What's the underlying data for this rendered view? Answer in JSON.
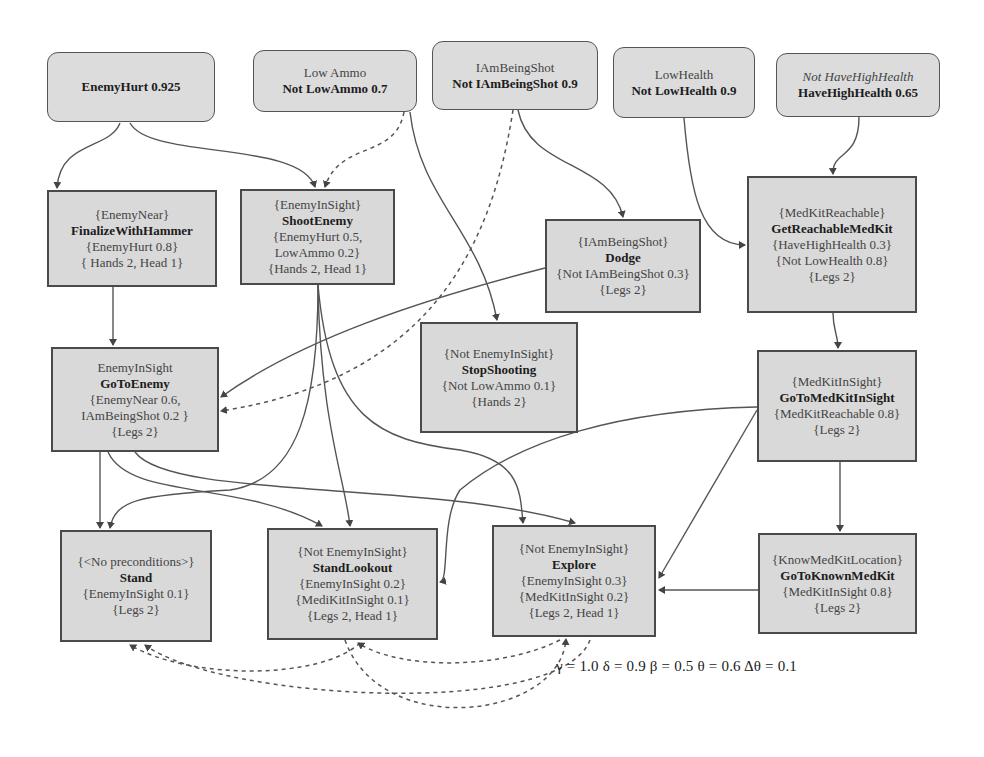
{
  "goals": [
    {
      "id": "enemy-hurt",
      "lines": [
        {
          "text": "EnemyHurt 0.925",
          "style": "bold"
        }
      ]
    },
    {
      "id": "low-ammo",
      "lines": [
        {
          "text": "Low Ammo",
          "style": "light"
        },
        {
          "text": "Not LowAmmo 0.7",
          "style": "bold"
        }
      ]
    },
    {
      "id": "i-am-being-shot",
      "lines": [
        {
          "text": "IAmBeingShot",
          "style": "light"
        },
        {
          "text": "Not IAmBeingShot 0.9",
          "style": "bold"
        }
      ]
    },
    {
      "id": "low-health",
      "lines": [
        {
          "text": "LowHealth",
          "style": "light"
        },
        {
          "text": "Not LowHealth 0.9",
          "style": "bold"
        }
      ]
    },
    {
      "id": "have-high-health",
      "lines": [
        {
          "text": "Not HaveHighHealth",
          "style": "ital"
        },
        {
          "text": "HaveHighHealth 0.65",
          "style": "bold"
        }
      ]
    }
  ],
  "actions": [
    {
      "id": "finalize-with-hammer",
      "precondition": "{EnemyNear}",
      "name": "FinalizeWithHammer",
      "effects": [
        "{EnemyHurt 0.8}"
      ],
      "resources": "{ Hands 2, Head 1}"
    },
    {
      "id": "shoot-enemy",
      "precondition": "{EnemyInSight}",
      "name": "ShootEnemy",
      "effects": [
        "{EnemyHurt 0.5,",
        "LowAmmo 0.2}"
      ],
      "resources": "{Hands 2, Head 1}"
    },
    {
      "id": "dodge",
      "precondition": "{IAmBeingShot}",
      "name": "Dodge",
      "effects": [
        "{Not IAmBeingShot 0.3}"
      ],
      "resources": "{Legs 2}"
    },
    {
      "id": "get-reachable-medkit",
      "precondition": "{MedKitReachable}",
      "name": "GetReachableMedKit",
      "effects": [
        "{HaveHighHealth 0.3}",
        "{Not LowHealth 0.8}"
      ],
      "resources": "{Legs 2}"
    },
    {
      "id": "stop-shooting",
      "precondition": "{Not EnemyInSight}",
      "name": "StopShooting",
      "effects": [
        "{Not LowAmmo 0.1}"
      ],
      "resources": "{Hands 2}"
    },
    {
      "id": "go-to-enemy",
      "precondition": "EnemyInSight",
      "name": "GoToEnemy",
      "effects": [
        "{EnemyNear 0.6,",
        "IAmBeingShot 0.2 }"
      ],
      "resources": "{Legs 2}"
    },
    {
      "id": "go-to-medkit-in-sight",
      "precondition": "{MedKitInSight}",
      "name": "GoToMedKitInSight",
      "effects": [
        "{MedKitReachable 0.8}"
      ],
      "resources": "{Legs 2}"
    },
    {
      "id": "stand",
      "precondition": "{<No preconditions>}",
      "name": "Stand",
      "effects": [
        "{EnemyInSight 0.1}"
      ],
      "resources": "{Legs 2}"
    },
    {
      "id": "stand-lookout",
      "precondition": "{Not EnemyInSight}",
      "name": "StandLookout",
      "effects": [
        "{EnemyInSight 0.2}",
        "{MediKitInSight 0.1}"
      ],
      "resources": "{Legs 2, Head 1}"
    },
    {
      "id": "explore",
      "precondition": "{Not EnemyInSight}",
      "name": "Explore",
      "effects": [
        "{EnemyInSight 0.3}",
        "{MedKitInSight 0.2}"
      ],
      "resources": "{Legs 2, Head 1}"
    },
    {
      "id": "go-to-known-medkit",
      "precondition": "{KnowMedKitLocation}",
      "name": "GoToKnownMedKit",
      "effects": [
        "{MedKitInSight 0.8}"
      ],
      "resources": "{Legs 2}"
    }
  ],
  "parameters": {
    "text": "γ = 1.0  δ = 0.9  β = 0.5   θ = 0.6   Δθ = 0.1",
    "gamma": 1.0,
    "delta": 0.9,
    "beta": 0.5,
    "theta": 0.6,
    "delta_theta": 0.1
  },
  "colors": {
    "node_fill": "#d9d9d9",
    "node_border": "#4a4a4a",
    "edge": "#555555"
  }
}
